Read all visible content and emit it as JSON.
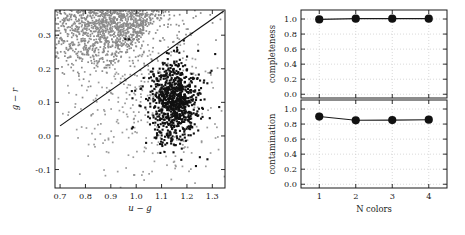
{
  "figure": {
    "background": "#ffffff",
    "gray_color": "#8a8a8a",
    "black_color": "#111111"
  },
  "chart_data": [
    {
      "type": "scatter",
      "panel": "left",
      "title": "",
      "xlabel": "u − g",
      "ylabel": "g − r",
      "xlim": [
        0.68,
        1.35
      ],
      "ylim": [
        -0.155,
        0.375
      ],
      "xticks": [
        0.7,
        0.8,
        0.9,
        1.0,
        1.1,
        1.2,
        1.3
      ],
      "xticklabels": [
        "0.7",
        "0.8",
        "0.9",
        "1.0",
        "1.1",
        "1.2",
        "1.3"
      ],
      "yticks": [
        -0.1,
        0.0,
        0.1,
        0.2,
        0.3
      ],
      "yticklabels": [
        "-0.1",
        "0.0",
        "0.1",
        "0.2",
        "0.3"
      ],
      "grid": false,
      "series": [
        {
          "name": "background-sources",
          "color": "#8a8a8a",
          "marker": "point",
          "marker_size": 1.6,
          "description": "dense gray cloud saturating upper-left region",
          "cloud": {
            "n_points": 2600,
            "center_x": 0.93,
            "center_y": 0.345,
            "spread_x": 0.16,
            "spread_y": 0.075,
            "n_scatter": 420,
            "scatter_center_x": 1.05,
            "scatter_center_y": 0.12,
            "scatter_spread_x": 0.17,
            "scatter_spread_y": 0.13
          }
        },
        {
          "name": "selected-quasars",
          "color": "#111111",
          "marker": "square",
          "marker_size": 2.0,
          "description": "compact black cluster of selected objects",
          "cloud": {
            "n_points": 880,
            "center_x": 1.148,
            "center_y": 0.104,
            "spread_x": 0.043,
            "spread_y": 0.055
          }
        }
      ],
      "annotations": [
        {
          "type": "line",
          "name": "decision-boundary",
          "x0": 0.7,
          "y0": 0.03,
          "x1": 1.345,
          "y1": 0.372,
          "color": "#111111"
        }
      ]
    },
    {
      "type": "line",
      "panel": "top-right",
      "title": "",
      "xlabel": "",
      "ylabel": "completeness",
      "categories": [
        1,
        2,
        3,
        4
      ],
      "x": [
        1,
        2,
        3,
        4
      ],
      "values": [
        0.995,
        1.005,
        1.005,
        1.005
      ],
      "xlim": [
        0.5,
        4.5
      ],
      "ylim": [
        -0.05,
        1.12
      ],
      "xticks": [
        1,
        2,
        3,
        4
      ],
      "xticklabels": [
        "1",
        "2",
        "3",
        "4"
      ],
      "yticks": [
        0.0,
        0.2,
        0.4,
        0.6,
        0.8,
        1.0
      ],
      "yticklabels": [
        "0.0",
        "0.2",
        "0.4",
        "0.6",
        "0.8",
        "1.0"
      ],
      "grid": true,
      "marker": "circle",
      "color": "#111111"
    },
    {
      "type": "line",
      "panel": "bottom-right",
      "title": "",
      "xlabel": "N colors",
      "ylabel": "contamination",
      "categories": [
        1,
        2,
        3,
        4
      ],
      "x": [
        1,
        2,
        3,
        4
      ],
      "values": [
        0.9,
        0.85,
        0.853,
        0.858
      ],
      "xlim": [
        0.5,
        4.5
      ],
      "ylim": [
        -0.05,
        1.12
      ],
      "xticks": [
        1,
        2,
        3,
        4
      ],
      "xticklabels": [
        "1",
        "2",
        "3",
        "4"
      ],
      "yticks": [
        0.0,
        0.2,
        0.4,
        0.6,
        0.8,
        1.0
      ],
      "yticklabels": [
        "0.0",
        "0.2",
        "0.4",
        "0.6",
        "0.8",
        "1.0"
      ],
      "grid": true,
      "marker": "circle",
      "color": "#111111"
    }
  ]
}
